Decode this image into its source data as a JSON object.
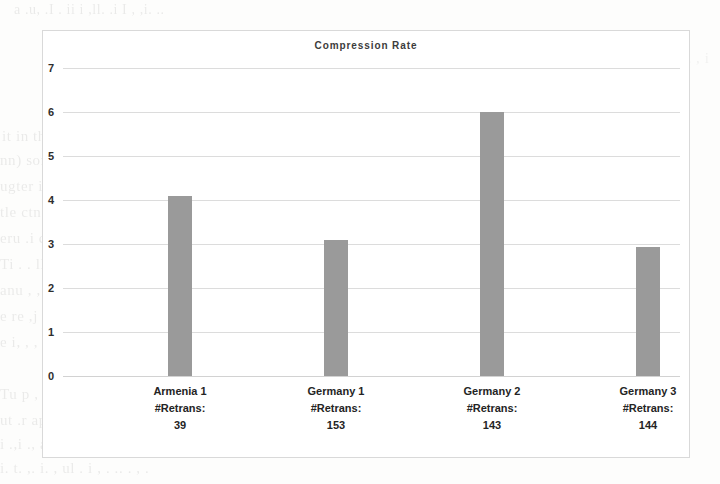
{
  "figure": {
    "frame_border_color": "#d9d9d9",
    "background_color": "#ffffff"
  },
  "chart_data": {
    "type": "bar",
    "title": "Compression Rate",
    "xlabel": "",
    "ylabel": "",
    "ylim": [
      0,
      7
    ],
    "yticks": [
      0,
      1,
      2,
      3,
      4,
      5,
      6,
      7
    ],
    "grid": true,
    "legend": null,
    "bar_color": "#9a9a9a",
    "categories": [
      "Armenia 1\n#Retrans:\n39",
      "Germany 1\n#Retrans:\n153",
      "Germany 2\n#Retrans:\n143",
      "Germany 3\n#Retrans:\n144"
    ],
    "category_parts": [
      {
        "name": "Armenia 1",
        "retrans_label": "#Retrans:",
        "retrans_value": "39"
      },
      {
        "name": "Germany 1",
        "retrans_label": "#Retrans:",
        "retrans_value": "153"
      },
      {
        "name": "Germany 2",
        "retrans_label": "#Retrans:",
        "retrans_value": "143"
      },
      {
        "name": "Germany 3",
        "retrans_label": "#Retrans:",
        "retrans_value": "144"
      }
    ],
    "values": [
      4.1,
      3.1,
      6.0,
      2.93
    ],
    "ytick_labels": [
      "7",
      "6",
      "5",
      "4",
      "3",
      "2",
      "1",
      "0"
    ]
  },
  "page_bleed": {
    "lines": [
      "a .u,  .I  .       ii    i    ,ll.      .i  I   ,        ,i.    ..",
      "ing",
      "it   in the   ,ai,(), i   ll   .er  ,  .ii  to   r  this",
      "nn) some l , ullt   ,  e supp       alle    ted  eq. 1 .us ted",
      "ugter  i   ca .rd .     ,  ng  ,   .ee  i  le  r  i   i  h       i",
      "tle   ctn cpn .i,  po  de   l    ,ourn,t,.lu  .,   ,  lt,   ,  ,",
      "eru   .i  c  . . .  .b   l   ,lue   .  l  ,lbe  ti  pu   lu",
      "Ti  .  .   ll  , .  ,i,hl   ,  u.   .llt.  t   i  .,.   .   , ,",
      "anu   , ,  .,ll  u  .   i udy     ,.. l i    ..  ,tmes",
      "e  re  ,j mc  .   ll .    s   h   ,i  ll ,  d   l",
      "e   i,  ,   ,    .     i       ,       ,i     ,  . ,   ..",
      "Tu    p     ,  I    ,,  .  ,l .    l  . ,,   ,  .    ,    , ..",
      "ut    .r  app    . . ..s    ,    .i  se   , . ,  ,. ,ing   l  ull",
      "i .,i  .,  are olli  .i  pu.  .A     ,pe   .l.  .,   i. ,,,jin   tl.",
      "i.   t.   ,. i. ,  ul   .      i     ,  .    ..  .   ,       .",
      "..i  .  ,  .    ,, ,.  .  .   l,    .   l     ,  ,  , i"
    ]
  }
}
